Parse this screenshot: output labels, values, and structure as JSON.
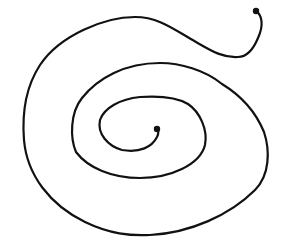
{
  "diagram": {
    "type": "spiral",
    "stroke_color": "#111111",
    "background": "#ffffff",
    "start_point": {
      "x": 256,
      "y": 11
    },
    "end_point": {
      "x": 157,
      "y": 129
    }
  }
}
